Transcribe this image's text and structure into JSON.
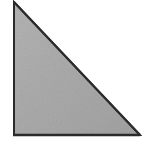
{
  "figure": {
    "name": "right-triangle",
    "caption": "",
    "background_color": "#ffffff",
    "fill_color": "#ababab",
    "fill_color_light": "#b4b4b4",
    "fill_color_dark": "#a2a2a2",
    "stroke_color": "#2b2b2b",
    "stroke_width": 2,
    "canvas": {
      "width": 153,
      "height": 146
    },
    "vertices": [
      {
        "label": "apex",
        "x": 14,
        "y": 2
      },
      {
        "label": "bottom-left",
        "x": 14,
        "y": 135
      },
      {
        "label": "bottom-right",
        "x": 140,
        "y": 135
      }
    ],
    "polygon_points": "14,2 14,135 140,135",
    "edges": [
      {
        "name": "vertical-leg",
        "from": "apex",
        "to": "bottom-left"
      },
      {
        "name": "horizontal-leg",
        "from": "bottom-left",
        "to": "bottom-right"
      },
      {
        "name": "hypotenuse",
        "from": "bottom-right",
        "to": "apex"
      }
    ]
  }
}
